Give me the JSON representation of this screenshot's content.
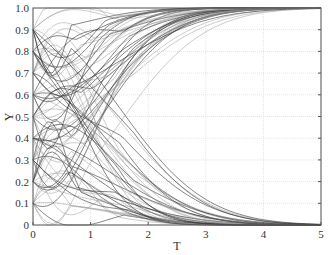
{
  "chart_data": {
    "type": "line",
    "title": "",
    "xlabel": "T",
    "ylabel": "Y",
    "xlim": [
      0,
      5
    ],
    "ylim": [
      0,
      1.0
    ],
    "x_ticks": [
      "0",
      "1",
      "2",
      "3",
      "4",
      "5"
    ],
    "y_ticks": [
      "0",
      "0.1",
      "0.2",
      "0.3",
      "0.4",
      "0.5",
      "0.6",
      "0.7",
      "0.8",
      "0.9",
      "1.0"
    ],
    "grid": true,
    "legend": null,
    "initial_values": [
      0.1,
      0.2,
      0.3,
      0.4,
      0.5,
      0.6,
      0.7,
      0.8,
      0.9
    ],
    "series": [
      {
        "name": "to-one",
        "end_value": 1.0
      },
      {
        "name": "to-zero",
        "end_value": 0.0
      }
    ]
  },
  "axes": {
    "x_label": "T",
    "y_label": "Y"
  },
  "colors": {
    "line_dark": "#333333",
    "line_light": "#9a9a9a",
    "grid": "#e4e4e4",
    "axis": "#555555"
  }
}
